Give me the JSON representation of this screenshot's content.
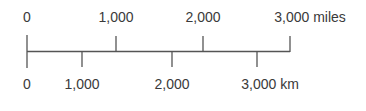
{
  "scale_bar": {
    "miles": {
      "unit": "miles",
      "ticks": [
        {
          "label": "0",
          "x": 27
        },
        {
          "label": "1,000",
          "x": 116
        },
        {
          "label": "2,000",
          "x": 203
        },
        {
          "label": "3,000 miles",
          "x": 290
        }
      ]
    },
    "km": {
      "unit": "km",
      "ticks": [
        {
          "label": "0",
          "x": 27
        },
        {
          "label": "1,000",
          "x": 82
        },
        {
          "label": "2,000",
          "x": 172
        },
        {
          "label": "3,000 km",
          "x": 257
        }
      ]
    },
    "line_color": "#555555",
    "text_color": "#3a3a3a"
  }
}
